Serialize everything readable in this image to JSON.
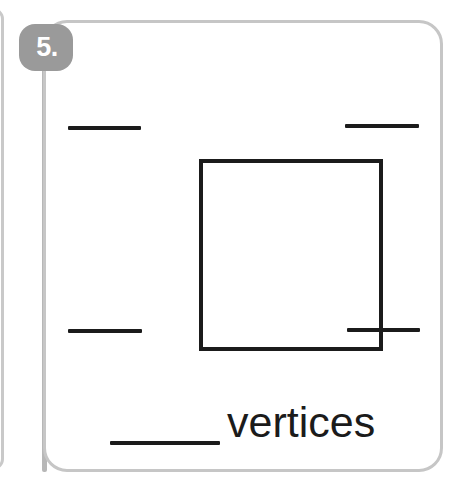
{
  "worksheet": {
    "item_number_label": "5.",
    "badge_color": "#9a9a9a",
    "badge_text_color": "#ffffff",
    "card_border_color": "#c6c6c6",
    "ink_color": "#1b1b1b",
    "background_color": "#ffffff",
    "spine_color": "#b7b7b7"
  },
  "figure": {
    "shape_name": "square",
    "corner_blanks": [
      {
        "position_label": "top-left",
        "value": ""
      },
      {
        "position_label": "top-right",
        "value": ""
      },
      {
        "position_label": "bottom-left",
        "value": ""
      },
      {
        "position_label": "bottom-right",
        "value": ""
      }
    ]
  },
  "answer": {
    "blank_value": "",
    "word": "vertices"
  }
}
